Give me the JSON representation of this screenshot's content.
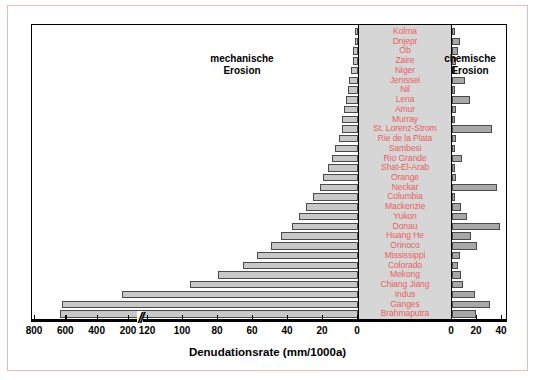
{
  "figure": {
    "xlabel": "Denudationsrate (mm/1000a)",
    "annotation_left": "mechanische\nErosion",
    "annotation_left_line1": "mechanische",
    "annotation_left_line2": "Erosion",
    "annotation_right_line1": "chemische",
    "annotation_right_line2": "Erosion",
    "accent_label_color": "#e8615f",
    "bar_fill_left": "#c8c8c8",
    "bar_fill_right": "#a8a8a8",
    "band_color": "#d6d6d6",
    "frame_color": "#f0b8b8"
  },
  "axis": {
    "break_marker": "//",
    "left_outer_ticks": [
      "800",
      "600",
      "400",
      "200"
    ],
    "left_inner_ticks": [
      "120",
      "100",
      "80",
      "60",
      "40",
      "20",
      "0"
    ],
    "right_ticks": [
      "0",
      "20",
      "40"
    ],
    "left_outer_max": 900,
    "left_inner_max": 130,
    "right_max": 45
  },
  "chart_data": {
    "type": "bar",
    "orientation": "horizontal",
    "title": "",
    "subtitle": "",
    "xlabel": "Denudationsrate (mm/1000a)",
    "ylabel": "",
    "grid": false,
    "legend_position": "inside-annotations",
    "annotations": [
      "mechanische Erosion",
      "chemische Erosion"
    ],
    "axis_note": "Broken x-axis: left wing shows mechanische Erosion (values decrease left-to-right toward 0, with a break between 200 and 120); right wing shows chemische Erosion 0-40.",
    "categories": [
      "Kolma",
      "Dnjepr",
      "Ob",
      "Zaire",
      "Niger",
      "Jenissei",
      "Nil",
      "Lena",
      "Amur",
      "Murray",
      "St. Lorenz-Strom",
      "Rie de la Plata",
      "Sambesi",
      "Rio Grande",
      "Shat-El-Arab",
      "Orange",
      "Neckar",
      "Columbia",
      "Mackenzie",
      "Yukon",
      "Donau",
      "Huang He",
      "Orinoco",
      "Mississippi",
      "Colorado",
      "Mekong",
      "Chiang Jiang",
      "Indus",
      "Ganges",
      "Brahmaputra"
    ],
    "series": [
      {
        "name": "mechanische Erosion",
        "unit": "mm/1000a",
        "values": [
          2,
          2,
          3,
          3,
          4,
          5,
          6,
          7,
          8,
          9,
          9,
          11,
          13,
          15,
          17,
          20,
          22,
          26,
          30,
          34,
          38,
          44,
          50,
          58,
          66,
          80,
          96,
          245,
          630,
          640
        ]
      },
      {
        "name": "chemische Erosion",
        "unit": "mm/1000a",
        "values": [
          2,
          6,
          5,
          3,
          2,
          10,
          2,
          14,
          3,
          2,
          32,
          3,
          2,
          8,
          2,
          3,
          36,
          2,
          7,
          12,
          38,
          15,
          20,
          6,
          5,
          7,
          9,
          18,
          30,
          19
        ]
      }
    ]
  }
}
